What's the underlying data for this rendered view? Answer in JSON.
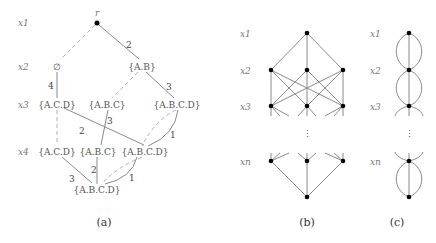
{
  "panel_a": {
    "caption": "(a)",
    "root_label": "r",
    "row_labels": [
      "x1",
      "x2",
      "x3",
      "x4"
    ],
    "row2": {
      "left": "∅",
      "right": "{A.B}"
    },
    "row3": {
      "left": "{A.C.D}",
      "mid": "{A.B.C}",
      "right": "{A.B.C.D}"
    },
    "row4": {
      "left": "{A.C.D}",
      "mid": "{A.B.C}",
      "right": "{A.B.C.D}"
    },
    "terminal": "{A.B.C.D}",
    "weights": {
      "r_to_AB": "2",
      "empty_to_ACD": "4",
      "AB_to_ABCD": "3",
      "ACD_to_ABCD": "2",
      "ABC_to_ABC": "3",
      "ABCD_to_ABCD": "1",
      "ACD_to_T": "3",
      "ABC_to_T": "2",
      "ABCD_to_T": "1"
    }
  },
  "panel_b": {
    "caption": "(b)",
    "row_labels": [
      "x1",
      "x2",
      "x3",
      "xn"
    ],
    "ellipsis": "⋮"
  },
  "panel_c": {
    "caption": "(c)",
    "row_labels": [
      "x1",
      "x2",
      "x3",
      "xn"
    ],
    "ellipsis": "⋮"
  }
}
